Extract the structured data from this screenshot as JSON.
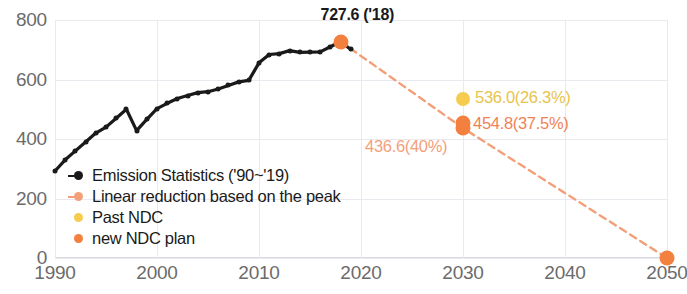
{
  "chart_data": {
    "type": "line",
    "title": "",
    "xlabel": "",
    "ylabel": "",
    "xlim": [
      1990,
      2050
    ],
    "ylim": [
      0,
      800
    ],
    "xticks": [
      "1990",
      "2000",
      "2010",
      "2020",
      "2030",
      "2040",
      "2050"
    ],
    "yticks": [
      "0",
      "200",
      "400",
      "600",
      "800"
    ],
    "grid": true,
    "legend_position": "inside-lower-left",
    "series": [
      {
        "name": "Emission Statistics ('90~'19)",
        "color": "#1a1a1a",
        "style": "solid-with-markers",
        "x": [
          1990,
          1991,
          1992,
          1993,
          1994,
          1995,
          1996,
          1997,
          1998,
          1999,
          2000,
          2001,
          2002,
          2003,
          2004,
          2005,
          2006,
          2007,
          2008,
          2009,
          2010,
          2011,
          2012,
          2013,
          2014,
          2015,
          2016,
          2017,
          2018,
          2019
        ],
        "values": [
          292.5,
          330.0,
          360.0,
          390.0,
          420.0,
          440.0,
          470.0,
          500.0,
          428.0,
          466.0,
          502.0,
          520.0,
          536.0,
          546.0,
          556.0,
          559.0,
          568.0,
          580.0,
          592.0,
          597.0,
          656.0,
          684.0,
          687.0,
          697.0,
          691.0,
          692.0,
          693.0,
          710.0,
          727.6,
          701.0
        ]
      },
      {
        "name": "Linear reduction based on the peak",
        "color": "#f3a07a",
        "style": "dashed",
        "x": [
          2018,
          2030,
          2050
        ],
        "values": [
          727.6,
          436.6,
          0
        ]
      },
      {
        "name": "Past NDC",
        "color": "#f5cc4d",
        "style": "point",
        "x": [
          2030
        ],
        "values": [
          536.0
        ]
      },
      {
        "name": "new NDC plan",
        "color": "#f3803f",
        "style": "point",
        "x": [
          2030
        ],
        "values": [
          454.8
        ]
      }
    ],
    "annotations": [
      {
        "id": "peak",
        "text": "727.6 ('18)",
        "x": 2018,
        "y": 727.6,
        "color": "#1a1a1a"
      },
      {
        "id": "past-ndc",
        "text": "536.0(26.3%)",
        "x": 2030,
        "y": 536.0,
        "color": "#e8c44a"
      },
      {
        "id": "new-ndc",
        "text": "454.8(37.5%)",
        "x": 2030,
        "y": 454.8,
        "color": "#f08254"
      },
      {
        "id": "linear",
        "text": "436.6(40%)",
        "x": 2030,
        "y": 436.6,
        "color": "#f3a07a"
      }
    ]
  },
  "legend": {
    "items": [
      {
        "label": "Emission Statistics ('90~'19)",
        "color": "#1a1a1a",
        "has_line": true
      },
      {
        "label": "Linear reduction based on the peak",
        "color": "#f3a07a",
        "has_line": true
      },
      {
        "label": "Past NDC",
        "color": "#f5cc4d",
        "has_line": false
      },
      {
        "label": "new NDC plan",
        "color": "#f3803f",
        "has_line": false
      }
    ]
  }
}
